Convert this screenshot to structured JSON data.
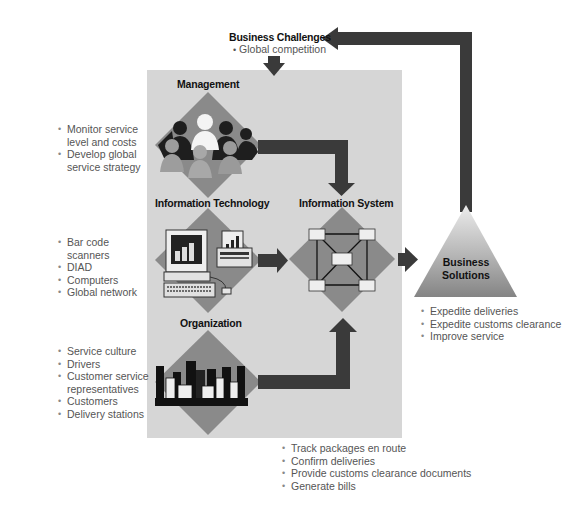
{
  "diagram": {
    "business_challenges": {
      "title": "Business Challenges",
      "items": [
        "Global competition"
      ]
    },
    "management": {
      "title": "Management",
      "icon": "people-silhouettes-icon",
      "items": [
        "Monitor service level and costs",
        "Develop global service strategy"
      ],
      "items_lines": [
        [
          "Monitor service",
          "level and costs"
        ],
        [
          "Develop global",
          "service strategy"
        ]
      ]
    },
    "information_technology": {
      "title": "Information Technology",
      "icon": "computer-and-printer-icon",
      "items": [
        "Bar code scanners",
        "DIAD",
        "Computers",
        "Global network"
      ]
    },
    "organization": {
      "title": "Organization",
      "icon": "city-buildings-icon",
      "items": [
        "Service culture",
        "Drivers",
        "Customer service representatives",
        "Customers",
        "Delivery stations"
      ],
      "items_lines": [
        [
          "Service culture"
        ],
        [
          "Drivers"
        ],
        [
          "Customer service",
          "representatives"
        ],
        [
          "Customers"
        ],
        [
          "Delivery stations"
        ]
      ]
    },
    "information_system": {
      "title": "Information System",
      "icon": "network-nodes-icon",
      "items": [
        "Track packages en route",
        "Confirm deliveries",
        "Provide customs clearance documents",
        "Generate bills"
      ]
    },
    "business_solutions": {
      "title_line1": "Business",
      "title_line2": "Solutions",
      "items": [
        "Expedite deliveries",
        "Expedite customs clearance",
        "Improve service"
      ]
    },
    "colors": {
      "panel": "#d6d6d6",
      "diamond": "#8a8a8a",
      "arrow": "#3a3a3a",
      "triangle_top": "#e6e6e6",
      "triangle_bottom": "#8c8c8c",
      "text": "#111111",
      "bullet_text": "#555555"
    }
  }
}
